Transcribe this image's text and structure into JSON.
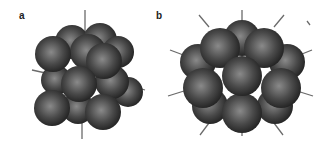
{
  "figure": {
    "panels": [
      {
        "label": "a",
        "description": "cuboctahedral cluster of 13 spheres",
        "label_x": 19,
        "label_y": 10
      },
      {
        "label": "b",
        "description": "icosahedral cluster of 13 spheres",
        "label_x": 156,
        "label_y": 10
      }
    ],
    "colors": {
      "sphere_light": "#8a8a8a",
      "sphere_mid": "#4a4a4a",
      "sphere_dark": "#1e1e1e",
      "axis": "#6a6a6a"
    }
  }
}
